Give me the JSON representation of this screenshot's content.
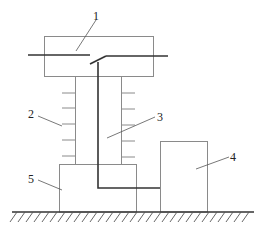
{
  "diagram": {
    "type": "technical-schematic",
    "labels": [
      {
        "id": "1",
        "text": "1",
        "part": "top-housing-with-contacts"
      },
      {
        "id": "2",
        "text": "2",
        "part": "insulator-sheds"
      },
      {
        "id": "3",
        "text": "3",
        "part": "insulating-column-with-conductor"
      },
      {
        "id": "4",
        "text": "4",
        "part": "side-box"
      },
      {
        "id": "5",
        "text": "5",
        "part": "base"
      }
    ],
    "colors": {
      "line": "#8a8a8a",
      "conductor": "#333333",
      "text": "#222222",
      "background": "#ffffff"
    }
  }
}
